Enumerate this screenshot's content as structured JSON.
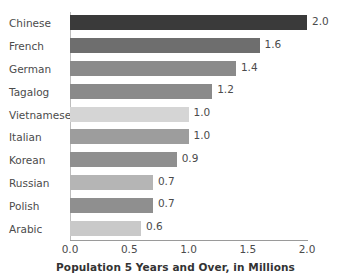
{
  "chart_data": {
    "type": "bar",
    "orientation": "horizontal",
    "title": "",
    "xlabel": "Population 5 Years and Over, in Millions",
    "ylabel": "",
    "xlim": [
      0.0,
      2.0
    ],
    "xticks": [
      "0.0",
      "0.5",
      "1.0",
      "1.5",
      "2.0"
    ],
    "xtick_values": [
      0.0,
      0.5,
      1.0,
      1.5,
      2.0
    ],
    "grid": false,
    "legend": "none",
    "categories": [
      "Chinese",
      "French",
      "German",
      "Tagalog",
      "Vietnamese",
      "Italian",
      "Korean",
      "Russian",
      "Polish",
      "Arabic"
    ],
    "values": [
      2.0,
      1.6,
      1.4,
      1.2,
      1.0,
      1.0,
      0.9,
      0.7,
      0.7,
      0.6
    ],
    "value_labels": [
      "2.0",
      "1.6",
      "1.4",
      "1.2",
      "1.0",
      "1.0",
      "0.9",
      "0.7",
      "0.7",
      "0.6"
    ],
    "bar_colors": [
      "#3a3a3a",
      "#6e6e6e",
      "#8a8a8a",
      "#8a8a8a",
      "#d5d5d5",
      "#9d9d9d",
      "#8f8f8f",
      "#b5b5b5",
      "#8f8f8f",
      "#c9c9c9"
    ]
  }
}
